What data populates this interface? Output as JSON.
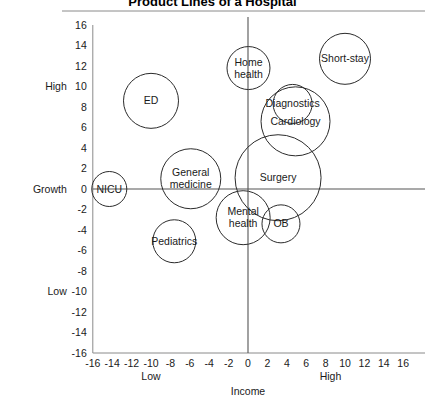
{
  "chart_data": {
    "type": "scatter",
    "title": "Product Lines of a Hospital",
    "xlabel": "Income",
    "ylabel": "Growth",
    "xlim": [
      -16,
      16
    ],
    "ylim": [
      -16,
      16
    ],
    "grid": false,
    "legend": "none",
    "xticks": [
      "-16",
      "-14",
      "-12",
      "-10",
      "-8",
      "-6",
      "-4",
      "-2",
      "0",
      "2",
      "4",
      "6",
      "8",
      "10",
      "12",
      "14",
      "16"
    ],
    "yticks": [
      "16",
      "14",
      "12",
      "10",
      "8",
      "6",
      "4",
      "2",
      "0",
      "-2",
      "-4",
      "-6",
      "-8",
      "-10",
      "-12",
      "-14",
      "-16"
    ],
    "x_low_label": "Low",
    "x_high_label": "High",
    "y_low_label": "Low",
    "y_high_label": "High",
    "bubbles": [
      {
        "label": "ED",
        "label_lines": [
          "ED"
        ],
        "x": -10.0,
        "y": 8.6,
        "r": 27.5
      },
      {
        "label": "NICU",
        "label_lines": [
          "NICU"
        ],
        "x": -14.3,
        "y": 0.0,
        "r": 17.5
      },
      {
        "label": "General medicine",
        "label_lines": [
          "General",
          "medicine"
        ],
        "x": -5.9,
        "y": 1.0,
        "r": 30.0
      },
      {
        "label": "Pediatrics",
        "label_lines": [
          "Pediatrics"
        ],
        "x": -7.6,
        "y": -5.1,
        "r": 21.5
      },
      {
        "label": "Home health",
        "label_lines": [
          "Home",
          "health"
        ],
        "x": 0.05,
        "y": 11.8,
        "r": 21.5
      },
      {
        "label": "Short-stay",
        "label_lines": [
          "Short-stay"
        ],
        "x": 10.0,
        "y": 12.7,
        "r": 25.5
      },
      {
        "label": "Diagnostics",
        "label_lines": [
          "Diagnostics"
        ],
        "x": 4.6,
        "y": 8.3,
        "r": 19.5
      },
      {
        "label": "Cardiology",
        "label_lines": [
          "Cardiology"
        ],
        "x": 4.9,
        "y": 6.6,
        "r": 34.5
      },
      {
        "label": "Surgery",
        "label_lines": [
          "Surgery"
        ],
        "x": 3.1,
        "y": 1.1,
        "r": 43.0
      },
      {
        "label": "Mental health",
        "label_lines": [
          "Mental",
          "health"
        ],
        "x": -0.5,
        "y": -2.8,
        "r": 27.0
      },
      {
        "label": "OB",
        "label_lines": [
          "OB"
        ],
        "x": 3.4,
        "y": -3.4,
        "r": 19.0
      }
    ]
  }
}
